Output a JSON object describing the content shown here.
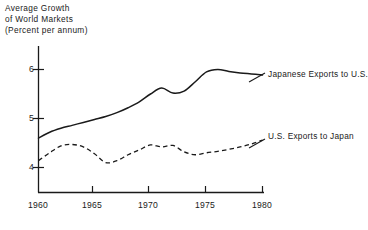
{
  "chart_data": {
    "type": "line",
    "title": "Average Growth\nof World Markets\n(Percent per annum)",
    "title_lines": [
      "Average Growth",
      "of World Markets",
      "(Percent per annum)"
    ],
    "xlabel": "",
    "ylabel": "Average Growth of World Markets (Percent per annum)",
    "xlim": [
      1960,
      1981.5
    ],
    "ylim": [
      3.62,
      6.45
    ],
    "grid": false,
    "legend_position": "right-inline-annotations",
    "xticks": [
      1960,
      1965,
      1970,
      1975,
      1980
    ],
    "xtick_labels": [
      "1960",
      "1965",
      "1970",
      "1975",
      "1980"
    ],
    "yticks": [
      4,
      5,
      6
    ],
    "ytick_labels": [
      "4",
      "5",
      "6"
    ],
    "series": [
      {
        "name": "Japanese Exports to U.S.",
        "label_lines": [
          "Japanese",
          "Exports to U.S."
        ],
        "style": "solid",
        "color": "#1a1a1a",
        "x": [
          1960,
          1961,
          1962,
          1963,
          1964,
          1965,
          1966,
          1967,
          1968,
          1969,
          1970,
          1971,
          1972,
          1973,
          1974,
          1975,
          1976,
          1977,
          1978,
          1979,
          1980
        ],
        "values": [
          4.6,
          4.72,
          4.8,
          4.86,
          4.92,
          4.98,
          5.04,
          5.12,
          5.22,
          5.34,
          5.5,
          5.62,
          5.52,
          5.56,
          5.75,
          5.95,
          6.0,
          5.96,
          5.93,
          5.91,
          5.89
        ]
      },
      {
        "name": "U.S. Exports to Japan",
        "label_lines": [
          "U.S. Exports",
          "to Japan"
        ],
        "style": "dashed",
        "color": "#1a1a1a",
        "x": [
          1960,
          1961,
          1962,
          1963,
          1964,
          1965,
          1966,
          1967,
          1968,
          1969,
          1970,
          1971,
          1972,
          1973,
          1974,
          1975,
          1976,
          1977,
          1978,
          1979,
          1980
        ],
        "values": [
          4.14,
          4.3,
          4.44,
          4.47,
          4.42,
          4.28,
          4.1,
          4.14,
          4.26,
          4.36,
          4.46,
          4.42,
          4.45,
          4.32,
          4.26,
          4.3,
          4.33,
          4.37,
          4.42,
          4.48,
          4.56
        ]
      }
    ]
  },
  "axes": {
    "y_axis_name": "value-axis",
    "x_axis_name": "year-axis"
  }
}
